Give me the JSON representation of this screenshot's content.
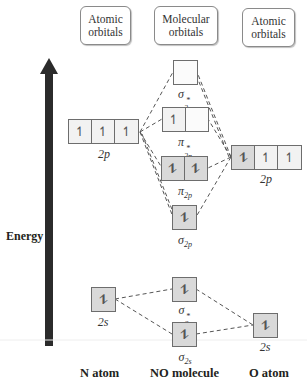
{
  "headers": {
    "left": {
      "line1": "Atomic",
      "line2": "orbitals"
    },
    "center": {
      "line1": "Molecular",
      "line2": "orbitals"
    },
    "right": {
      "line1": "Atomic",
      "line2": "orbitals"
    }
  },
  "axis": {
    "label": "Energy",
    "arrow_icon": "up-arrow-icon"
  },
  "bottom_labels": {
    "left": "N atom",
    "center": "NO molecule",
    "right": "O atom"
  },
  "orbitals": {
    "n_2p": {
      "label": "2p",
      "electrons": [
        "↿",
        "↿",
        "↿"
      ]
    },
    "o_2p": {
      "label": "2p",
      "electrons": [
        "⥮",
        "↿",
        "↿"
      ]
    },
    "n_2s": {
      "label": "2s",
      "electrons": [
        "⥮"
      ]
    },
    "o_2s": {
      "label": "2s",
      "electrons": [
        "⥮"
      ]
    },
    "sigma_star_2p": {
      "symbol": "σ",
      "sup": "*",
      "sub": "2p",
      "electrons": [
        ""
      ]
    },
    "pi_star_2p": {
      "symbol": "π",
      "sup": "*",
      "sub": "2p",
      "electrons": [
        "↿",
        ""
      ]
    },
    "pi_2p": {
      "symbol": "π",
      "sub": "2p",
      "electrons": [
        "⥮",
        "⥮"
      ]
    },
    "sigma_2p": {
      "symbol": "σ",
      "sub": "2p",
      "electrons": [
        "⥮"
      ]
    },
    "sigma_star_2s": {
      "symbol": "σ",
      "sup": "*",
      "sub": "2s",
      "electrons": [
        "⥮"
      ]
    },
    "sigma_2s": {
      "symbol": "σ",
      "sub": "2s",
      "electrons": [
        "⥮"
      ]
    }
  },
  "colors": {
    "box_border": "#6d6d6d",
    "filled": "#d9d9d9",
    "half": "#f2f2f2",
    "arrow": "#2b2b2b",
    "dashes": "#555555"
  }
}
